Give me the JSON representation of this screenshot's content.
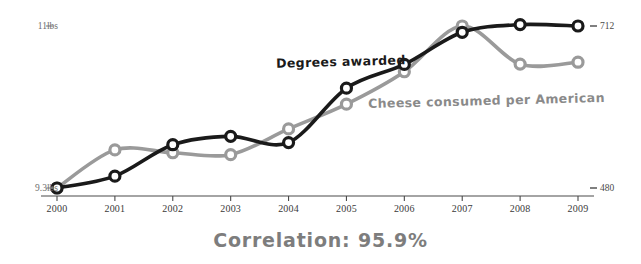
{
  "chart_data": {
    "type": "line",
    "title": "",
    "subtitle": "",
    "caption": "Correlation: 95.9%",
    "xlabel": "",
    "grid": false,
    "legend_position": "inline-annotations",
    "categories": [
      2000,
      2001,
      2002,
      2003,
      2004,
      2005,
      2006,
      2007,
      2008,
      2009
    ],
    "x_tick_labels": [
      "2000",
      "2001",
      "2002",
      "2003",
      "2004",
      "2005",
      "2006",
      "2007",
      "2008",
      "2009"
    ],
    "axes": {
      "left": {
        "name": "Cheese consumed per American",
        "unit": "lbs",
        "min": 9.3,
        "max": 11.0,
        "tick_labels": [
          "11lbs",
          "9.3lbs"
        ],
        "tick_values": [
          11.0,
          9.3
        ],
        "color": "#9a9a9a"
      },
      "right": {
        "name": "Degrees awarded",
        "unit": "",
        "min": 480,
        "max": 712,
        "tick_labels": [
          "712",
          "480"
        ],
        "tick_values": [
          712,
          480
        ],
        "color": "#1a1a1a"
      }
    },
    "series": [
      {
        "name": "Degrees awarded",
        "axis": "right",
        "color": "#1a1a1a",
        "marker": "circle-open",
        "values": [
          480,
          497,
          542,
          554,
          545,
          623,
          657,
          703,
          714,
          712
        ]
      },
      {
        "name": "Cheese consumed per American",
        "axis": "left",
        "color": "#9a9a9a",
        "marker": "circle-open",
        "values": [
          9.3,
          9.7,
          9.67,
          9.65,
          9.92,
          10.18,
          10.52,
          11.0,
          10.6,
          10.62
        ]
      }
    ],
    "annotations": [
      {
        "text": "Degrees awarded",
        "series": "Degrees awarded",
        "color": "#1a1a1a"
      },
      {
        "text": "Cheese consumed per American",
        "series": "Cheese consumed per American",
        "color": "#8a8a8a"
      }
    ]
  },
  "axis_labels": {
    "left_top": "11lbs",
    "left_bottom": "9.3lbs",
    "right_top": "712",
    "right_bottom": "480"
  },
  "colors": {
    "series_black": "#1a1a1a",
    "series_gray": "#9a9a9a",
    "axis": "#4a4a4a",
    "caption": "#7d7d7d",
    "background": "#ffffff"
  }
}
